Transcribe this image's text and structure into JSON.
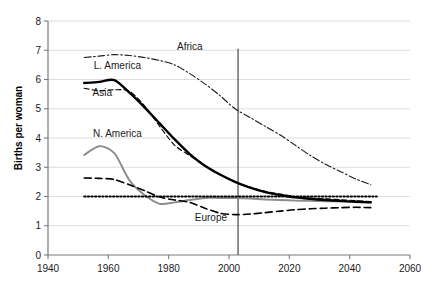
{
  "chart_data": {
    "type": "line",
    "title": "",
    "subtitle": "",
    "xlabel": "",
    "ylabel": "Births per woman",
    "xlim": [
      1940,
      2060
    ],
    "ylim": [
      0,
      8
    ],
    "xticks": [
      "1940",
      "1960",
      "1980",
      "2000",
      "2020",
      "2040",
      "2060"
    ],
    "yticks": [
      "0",
      "1",
      "2",
      "3",
      "4",
      "5",
      "6",
      "7",
      "8"
    ],
    "grid": "horizontal",
    "legend_position": "inline-annotations",
    "annotations": [
      {
        "text": "Africa",
        "x": 1987,
        "y": 7.0
      },
      {
        "text": "L. America",
        "x": 1963,
        "y": 6.35
      },
      {
        "text": "Asia",
        "x": 1958,
        "y": 5.45
      },
      {
        "text": "N. America",
        "x": 1963,
        "y": 4.05
      },
      {
        "text": "Europe",
        "x": 1994,
        "y": 1.15
      }
    ],
    "reference_lines": [
      {
        "name": "replacement-level",
        "orientation": "horizontal",
        "value": 2.0,
        "style": "dotted",
        "color": "#000000"
      },
      {
        "name": "present-year",
        "orientation": "vertical",
        "value": 2003,
        "style": "solid",
        "color": "#555555",
        "y_from": 0,
        "y_to": 7.05
      }
    ],
    "series": [
      {
        "name": "Africa",
        "style": "dash-dot",
        "color": "#1a1a1a",
        "width": 1.1,
        "x": [
          1952,
          1957,
          1962,
          1967,
          1972,
          1977,
          1982,
          1987,
          1992,
          1997,
          2002,
          2007,
          2012,
          2017,
          2022,
          2027,
          2032,
          2037,
          2042,
          2047
        ],
        "values": [
          6.75,
          6.8,
          6.85,
          6.82,
          6.75,
          6.65,
          6.5,
          6.2,
          5.85,
          5.45,
          5.0,
          4.7,
          4.4,
          4.1,
          3.75,
          3.4,
          3.1,
          2.85,
          2.6,
          2.4
        ]
      },
      {
        "name": "L. America",
        "style": "solid",
        "color": "#000000",
        "width": 2.4,
        "x": [
          1952,
          1957,
          1962,
          1967,
          1972,
          1977,
          1982,
          1987,
          1992,
          1997,
          2002,
          2007,
          2012,
          2017,
          2022,
          2027,
          2032,
          2037,
          2042,
          2047
        ],
        "values": [
          5.88,
          5.92,
          5.98,
          5.55,
          5.05,
          4.5,
          3.95,
          3.45,
          3.05,
          2.75,
          2.5,
          2.3,
          2.15,
          2.05,
          1.97,
          1.92,
          1.88,
          1.85,
          1.82,
          1.8
        ]
      },
      {
        "name": "Asia",
        "style": "dashed",
        "color": "#000000",
        "width": 1.1,
        "x": [
          1952,
          1957,
          1962,
          1967,
          1972,
          1977,
          1982,
          1987,
          1992,
          1997,
          2002,
          2007,
          2012,
          2017,
          2022,
          2027,
          2032,
          2037,
          2042,
          2047
        ],
        "values": [
          5.7,
          5.62,
          5.65,
          5.6,
          5.1,
          4.4,
          3.75,
          3.4,
          3.05,
          2.75,
          2.5,
          2.32,
          2.18,
          2.08,
          2.0,
          1.95,
          1.92,
          1.89,
          1.86,
          1.83
        ]
      },
      {
        "name": "N. America",
        "style": "solid",
        "color": "#8c8c8c",
        "width": 1.9,
        "x": [
          1952,
          1957,
          1962,
          1967,
          1972,
          1977,
          1982,
          1987,
          1992,
          1997,
          2002,
          2007,
          2012,
          2017,
          2022,
          2027,
          2032,
          2037,
          2042,
          2047
        ],
        "values": [
          3.42,
          3.72,
          3.48,
          2.55,
          2.05,
          1.75,
          1.8,
          1.88,
          1.95,
          1.95,
          1.95,
          1.93,
          1.9,
          1.88,
          1.86,
          1.85,
          1.84,
          1.83,
          1.82,
          1.8
        ]
      },
      {
        "name": "Europe",
        "style": "dashed",
        "color": "#000000",
        "width": 1.6,
        "x": [
          1952,
          1957,
          1962,
          1967,
          1972,
          1977,
          1982,
          1987,
          1992,
          1997,
          2002,
          2007,
          2012,
          2017,
          2022,
          2027,
          2032,
          2037,
          2042,
          2047
        ],
        "values": [
          2.63,
          2.62,
          2.58,
          2.4,
          2.2,
          1.98,
          1.88,
          1.8,
          1.6,
          1.43,
          1.38,
          1.4,
          1.45,
          1.5,
          1.55,
          1.58,
          1.6,
          1.62,
          1.63,
          1.62
        ]
      }
    ]
  }
}
